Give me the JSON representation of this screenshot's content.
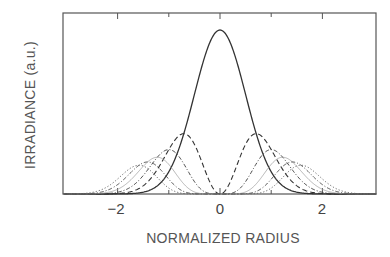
{
  "chart_data": {
    "type": "line",
    "title": "",
    "xlabel": "NORMALIZED RADIUS",
    "ylabel": "IRRADIANCE (a.u.)",
    "xlim": [
      -3.1,
      3.1
    ],
    "ylim": [
      0,
      1.1
    ],
    "grid": false,
    "legend": null,
    "x_ticks": [
      -2,
      -1,
      0,
      1,
      2
    ],
    "x_tick_labels": [
      "-2",
      "",
      "0",
      "",
      "2"
    ],
    "y_ticks": [],
    "formula": "I_n(r) = r^(2n) * exp(-2 r^2) * (2^n / n!) , peak of n at r = sqrt(n/2)",
    "series": [
      {
        "name": "n=0",
        "order": 0,
        "style": "solid",
        "color": "#333333",
        "peak_x": 0.0,
        "peak_y": 1.0
      },
      {
        "name": "n=1",
        "order": 1,
        "style": "dashed",
        "color": "#333333",
        "peak_x": 0.71,
        "peak_y": 0.37
      },
      {
        "name": "n=2",
        "order": 2,
        "style": "dash-dot",
        "color": "#444444",
        "peak_x": 1.0,
        "peak_y": 0.27
      },
      {
        "name": "n=3",
        "order": 3,
        "style": "thin-solid",
        "color": "#9a9a9a",
        "peak_x": 1.22,
        "peak_y": 0.22
      },
      {
        "name": "n=4",
        "order": 4,
        "style": "dash-dot",
        "color": "#555555",
        "peak_x": 1.41,
        "peak_y": 0.2
      },
      {
        "name": "n=5",
        "order": 5,
        "style": "dotted",
        "color": "#666666",
        "peak_x": 1.58,
        "peak_y": 0.18
      }
    ]
  },
  "axes": {
    "xlabel": "NORMALIZED RADIUS",
    "ylabel": "IRRADIANCE (a.u.)",
    "tick_labels": [
      "−2",
      "0",
      "2"
    ]
  }
}
